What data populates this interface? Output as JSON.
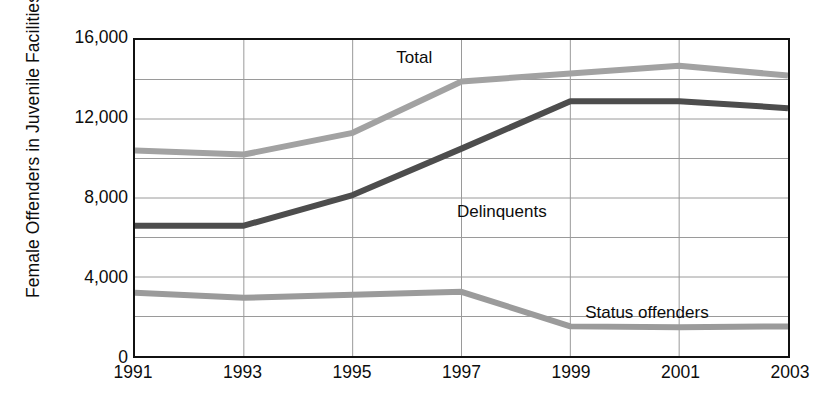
{
  "chart_data": {
    "type": "line",
    "title": "",
    "xlabel": "",
    "ylabel": "Female Offenders in Juvenile Facilities",
    "x": [
      1991,
      1993,
      1995,
      1997,
      1999,
      2001,
      2003
    ],
    "xtick_labels": [
      "1991",
      "1993",
      "1995",
      "1997",
      "1999",
      "2001",
      "2003"
    ],
    "ytick_labels": [
      "16,000",
      "12,000",
      "8,000",
      "4,000",
      "0"
    ],
    "ytick_values": [
      16000,
      12000,
      8000,
      4000,
      0
    ],
    "ylim": [
      0,
      16000
    ],
    "xlim": [
      1991,
      2003
    ],
    "grid": true,
    "grid_y_step": 2000,
    "grid_x_step": 2,
    "legend": "inline-labels",
    "series": [
      {
        "name": "Total",
        "color": "#a2a2a2",
        "values": [
          10400,
          10200,
          11300,
          13900,
          14300,
          14700,
          14200
        ],
        "label_x": 1996.1,
        "label_y": 15100
      },
      {
        "name": "Delinquents",
        "color": "#4d4d4d",
        "values": [
          6600,
          6600,
          8150,
          10500,
          12900,
          12900,
          12550
        ],
        "label_x": 1997.7,
        "label_y": 7400
      },
      {
        "name": "Status offenders",
        "color": "#9b9b9b",
        "values": [
          3200,
          2950,
          3100,
          3250,
          1500,
          1450,
          1500
        ],
        "label_x": 2000.35,
        "label_y": 2350
      }
    ]
  },
  "axis": {
    "y_title": "Female Offenders in Juvenile Facilities"
  }
}
